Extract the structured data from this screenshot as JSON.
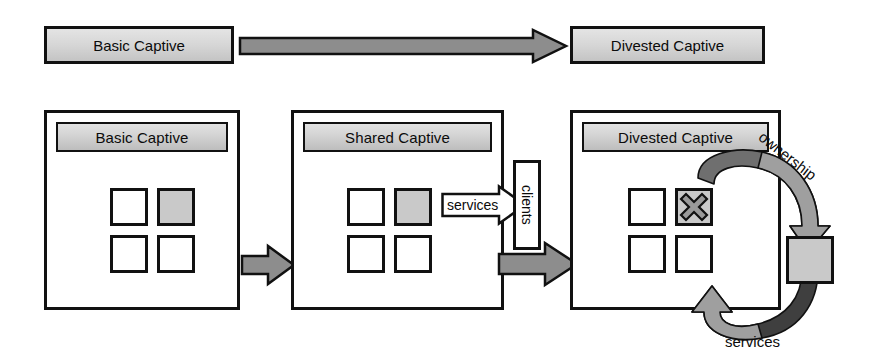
{
  "diagram": {
    "width": 881,
    "height": 363
  },
  "colors": {
    "outline": "#111111",
    "header_fill": "#d3d3d3",
    "shaded_unit": "#c9c9c9",
    "block_arrow_fill": "#8d8d8d",
    "curve_arrow_dark": "#4a4a4a",
    "curve_arrow_light": "#9a9a9a",
    "panel_fill": "#ffffff",
    "page_background": "#ffffff"
  },
  "summary_row": {
    "from_box": {
      "label": "Basic Captive"
    },
    "arrow": {
      "name": "summary-transition-arrow",
      "direction": "right"
    },
    "to_box": {
      "label": "Divested Captive"
    }
  },
  "panels": [
    {
      "id": "basic-captive",
      "header": "Basic Captive",
      "units": [
        {
          "position": "top-left",
          "shaded": false,
          "marked": false
        },
        {
          "position": "top-right",
          "shaded": true,
          "marked": false
        },
        {
          "position": "bottom-left",
          "shaded": false,
          "marked": false
        },
        {
          "position": "bottom-right",
          "shaded": false,
          "marked": false
        }
      ]
    },
    {
      "id": "shared-captive",
      "header": "Shared Captive",
      "units": [
        {
          "position": "top-left",
          "shaded": false,
          "marked": false
        },
        {
          "position": "top-right",
          "shaded": true,
          "marked": false
        },
        {
          "position": "bottom-left",
          "shaded": false,
          "marked": false
        },
        {
          "position": "bottom-right",
          "shaded": false,
          "marked": false
        }
      ],
      "outbound": {
        "arrow_label": "services",
        "target_label": "clients"
      }
    },
    {
      "id": "divested-captive",
      "header": "Divested Captive",
      "units": [
        {
          "position": "top-left",
          "shaded": false,
          "marked": false
        },
        {
          "position": "top-right",
          "shaded": true,
          "marked": true,
          "mark": "x-cross"
        },
        {
          "position": "bottom-left",
          "shaded": false,
          "marked": false
        },
        {
          "position": "bottom-right",
          "shaded": false,
          "marked": false
        }
      ],
      "detached_unit": {
        "shaded": true
      },
      "relationships": [
        {
          "label": "ownership",
          "from": "divested-unit",
          "to": "detached-unit",
          "style": "curved-arrow-clockwise"
        },
        {
          "label": "services",
          "from": "detached-unit",
          "to": "divested-captive-panel",
          "style": "curved-arrow-counterclockwise"
        }
      ]
    }
  ],
  "connectors": [
    {
      "name": "basic-to-shared-arrow",
      "direction": "right"
    },
    {
      "name": "shared-to-divested-arrow",
      "direction": "right"
    }
  ]
}
